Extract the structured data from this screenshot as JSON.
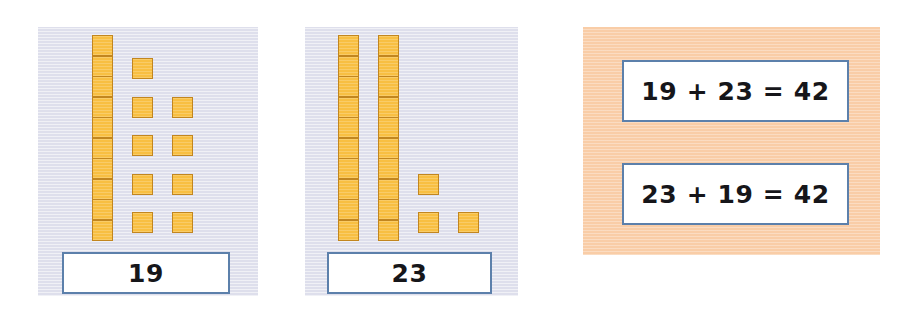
{
  "page": {
    "background_color": "#ffffff",
    "block_fill_color": "#f8bf42",
    "block_border_color": "#c2861f",
    "panel_background_color": "#dedfec",
    "equation_panel_color": "#f9cda7",
    "box_border_color": "#5c80ab"
  },
  "panels": [
    {
      "name": "addend-one",
      "label": "19",
      "tens_rods": 1,
      "tens_value": 10,
      "ones_units": 9,
      "ones_value": 9,
      "total": 19,
      "cubes_per_rod": 10
    },
    {
      "name": "addend-two",
      "label": "23",
      "tens_rods": 2,
      "tens_value": 20,
      "ones_units": 3,
      "ones_value": 3,
      "total": 23,
      "cubes_per_rod": 10
    }
  ],
  "equations": [
    {
      "name": "equation-one",
      "text": "19 + 23 = 42",
      "addend_a": 19,
      "addend_b": 23,
      "sum": 42
    },
    {
      "name": "equation-two",
      "text": "23 + 19 = 42",
      "addend_a": 23,
      "addend_b": 19,
      "sum": 42
    }
  ],
  "layout": {
    "panel_one": {
      "x": 38,
      "y": 27,
      "w": 220,
      "h": 269
    },
    "panel_two": {
      "x": 305,
      "y": 27,
      "w": 213,
      "h": 269
    },
    "panel_three": {
      "x": 583,
      "y": 27,
      "w": 297,
      "h": 228
    },
    "cube_size": 21,
    "rod_cube_pitch": 20.5,
    "unit_row_pitch": 38.5,
    "panel_one_rod_x": 92,
    "panel_one_rod_y": 35,
    "panel_one_unit_cols": [
      132,
      172
    ],
    "panel_one_unit_rows": [
      58,
      97,
      135,
      174,
      212
    ],
    "panel_one_unit_grid": [
      [
        1,
        0
      ],
      [
        1,
        1
      ],
      [
        1,
        1
      ],
      [
        1,
        1
      ],
      [
        1,
        1
      ]
    ],
    "panel_two_rod_xs": [
      338,
      378
    ],
    "panel_two_rod_y": 35,
    "panel_two_unit_cols": [
      418,
      458
    ],
    "panel_two_unit_rows": [
      174,
      212
    ],
    "panel_two_unit_grid": [
      [
        1,
        0
      ],
      [
        1,
        1
      ]
    ],
    "label_box_one": {
      "x": 62,
      "y": 252,
      "w": 168,
      "h": 42
    },
    "label_box_two": {
      "x": 327,
      "y": 252,
      "w": 165,
      "h": 42
    },
    "eq_box_one": {
      "x": 622,
      "y": 60,
      "w": 227,
      "h": 62
    },
    "eq_box_two": {
      "x": 622,
      "y": 163,
      "w": 227,
      "h": 62
    }
  }
}
